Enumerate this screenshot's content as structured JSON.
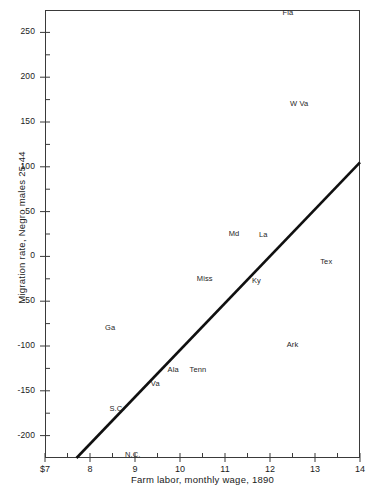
{
  "chart_data": {
    "type": "scatter",
    "title": "",
    "xlabel": "Farm labor, monthly wage, 1890",
    "ylabel": "Migration rate, Negro males 25-44",
    "xlim": [
      7,
      14
    ],
    "ylim": [
      -225,
      275
    ],
    "grid": false,
    "legend": "none",
    "x_ticks": [
      "$7",
      "8",
      "9",
      "10",
      "11",
      "12",
      "13",
      "14"
    ],
    "x_tick_values": [
      7,
      8,
      9,
      10,
      11,
      12,
      13,
      14
    ],
    "x_minor_ticks": [
      7.5,
      8.5,
      9.5,
      10.5,
      11.5,
      12.5,
      13.5
    ],
    "y_ticks": [
      "250",
      "200",
      "150",
      "100",
      "50",
      "0",
      "-50",
      "-100",
      "-150",
      "-200"
    ],
    "y_tick_values": [
      250,
      200,
      150,
      100,
      50,
      0,
      -50,
      -100,
      -150,
      -200
    ],
    "y_minor_ticks": [
      225,
      175,
      125,
      75,
      25,
      -25,
      -75,
      -125,
      -175,
      -225
    ],
    "point_style": "text-label-only",
    "points": [
      {
        "label": "Fla",
        "x": 12.4,
        "y": 272
      },
      {
        "label": "W Va",
        "x": 12.65,
        "y": 170
      },
      {
        "label": "Md",
        "x": 11.2,
        "y": 25
      },
      {
        "label": "La",
        "x": 11.85,
        "y": 24
      },
      {
        "label": "Tex",
        "x": 13.25,
        "y": -6
      },
      {
        "label": "Miss",
        "x": 10.55,
        "y": -25
      },
      {
        "label": "Ky",
        "x": 11.7,
        "y": -28
      },
      {
        "label": "Ga",
        "x": 8.45,
        "y": -80
      },
      {
        "label": "Ark",
        "x": 12.5,
        "y": -99
      },
      {
        "label": "Ala",
        "x": 9.85,
        "y": -127
      },
      {
        "label": "Tenn",
        "x": 10.4,
        "y": -127
      },
      {
        "label": "Va",
        "x": 9.45,
        "y": -142
      },
      {
        "label": "S.C.",
        "x": 8.6,
        "y": -170
      },
      {
        "label": "N.C.",
        "x": 8.95,
        "y": -222
      }
    ],
    "trend_line": {
      "label": "regression line",
      "x_start": 7.7,
      "y_start": -225,
      "x_end": 14.0,
      "y_end": 105,
      "color": "#101010",
      "width": 2.6
    }
  },
  "colors": {
    "axis": "#3a3a3a",
    "ink": "#1a1a1a",
    "label_ink": "#262626",
    "background": "#ffffff",
    "trend": "#101010"
  }
}
